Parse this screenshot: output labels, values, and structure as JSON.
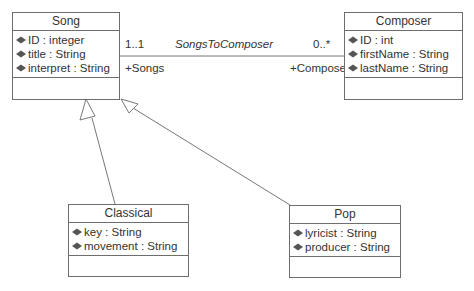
{
  "classes": {
    "song": {
      "name": "Song",
      "attributes": [
        "ID : integer",
        "title : String",
        "interpret : String"
      ]
    },
    "composer": {
      "name": "Composer",
      "attributes": [
        "ID : int",
        "firstName : String",
        "lastName : String"
      ]
    },
    "classical": {
      "name": "Classical",
      "attributes": [
        "key : String",
        "movement : String"
      ]
    },
    "pop": {
      "name": "Pop",
      "attributes": [
        "lyricist : String",
        "producer : String"
      ]
    }
  },
  "association": {
    "name": "SongsToComposer",
    "source_multiplicity": "1..1",
    "target_multiplicity": "0..*",
    "source_role": "+Songs",
    "target_role": "+Composer"
  },
  "generalizations": [
    {
      "child": "Classical",
      "parent": "Song"
    },
    {
      "child": "Pop",
      "parent": "Song"
    }
  ],
  "icons": {
    "attribute": "attribute-diamond-icon"
  }
}
